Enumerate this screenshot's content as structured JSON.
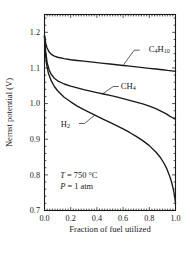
{
  "chart_data": {
    "type": "line",
    "title": "",
    "xlabel": "Fraction of fuel utilized",
    "ylabel": "Nernst potential (V)",
    "xlim": [
      0.0,
      1.0
    ],
    "ylim": [
      0.7,
      1.25
    ],
    "xticks": [
      0.0,
      0.2,
      0.4,
      0.6,
      0.8,
      1.0
    ],
    "xticklabels": [
      "0.0",
      "0.2",
      "0.4",
      "0.6",
      "0.8",
      "1.0"
    ],
    "yticks": [
      0.7,
      0.8,
      0.9,
      1.0,
      1.1,
      1.2
    ],
    "yticklabels": [
      "0.7",
      "0.8",
      "0.9",
      "1.0",
      "1.1",
      "1.2"
    ],
    "grid": false,
    "legend_position": "inline-labels",
    "minor_ticks": true,
    "tick_direction": "in",
    "frame": "box",
    "annotations": [
      {
        "name": "temperature",
        "text": "T = 750 °C",
        "x": 0.12,
        "y": 0.8
      },
      {
        "name": "pressure",
        "text": "P = 1 atm",
        "x": 0.12,
        "y": 0.768
      }
    ],
    "series": [
      {
        "name": "C4H10",
        "label": "C₄H₁₀",
        "label_x": 0.72,
        "label_y": 1.152,
        "color": "#1a1a1a",
        "points": [
          [
            0.0,
            1.19
          ],
          [
            0.01,
            1.168
          ],
          [
            0.02,
            1.156
          ],
          [
            0.035,
            1.145
          ],
          [
            0.05,
            1.139
          ],
          [
            0.075,
            1.133
          ],
          [
            0.1,
            1.13
          ],
          [
            0.15,
            1.126
          ],
          [
            0.2,
            1.123
          ],
          [
            0.25,
            1.121
          ],
          [
            0.3,
            1.119
          ],
          [
            0.35,
            1.117
          ],
          [
            0.4,
            1.115
          ],
          [
            0.45,
            1.113
          ],
          [
            0.5,
            1.111
          ],
          [
            0.55,
            1.109
          ],
          [
            0.6,
            1.107
          ],
          [
            0.65,
            1.105
          ],
          [
            0.7,
            1.103
          ],
          [
            0.75,
            1.101
          ],
          [
            0.8,
            1.099
          ],
          [
            0.85,
            1.097
          ],
          [
            0.9,
            1.095
          ],
          [
            0.94,
            1.093
          ],
          [
            0.97,
            1.092
          ],
          [
            0.99,
            1.091
          ],
          [
            1.0,
            1.09
          ]
        ]
      },
      {
        "name": "CH4",
        "label": "CH₄",
        "label_x": 0.56,
        "label_y": 1.048,
        "color": "#1a1a1a",
        "points": [
          [
            0.0,
            1.19
          ],
          [
            0.008,
            1.15
          ],
          [
            0.02,
            1.115
          ],
          [
            0.035,
            1.095
          ],
          [
            0.05,
            1.083
          ],
          [
            0.075,
            1.071
          ],
          [
            0.1,
            1.064
          ],
          [
            0.15,
            1.055
          ],
          [
            0.2,
            1.049
          ],
          [
            0.25,
            1.044
          ],
          [
            0.3,
            1.039
          ],
          [
            0.35,
            1.035
          ],
          [
            0.4,
            1.031
          ],
          [
            0.45,
            1.027
          ],
          [
            0.5,
            1.023
          ],
          [
            0.55,
            1.019
          ],
          [
            0.6,
            1.014
          ],
          [
            0.65,
            1.009
          ],
          [
            0.7,
            1.004
          ],
          [
            0.75,
            0.999
          ],
          [
            0.8,
            0.993
          ],
          [
            0.85,
            0.986
          ],
          [
            0.9,
            0.977
          ],
          [
            0.93,
            0.971
          ],
          [
            0.955,
            0.965
          ],
          [
            0.975,
            0.961
          ],
          [
            0.99,
            0.958
          ],
          [
            1.0,
            0.956
          ]
        ]
      },
      {
        "name": "H2",
        "label": "H₂",
        "label_x": 0.24,
        "label_y": 0.944,
        "color": "#1a1a1a",
        "points": [
          [
            0.0,
            1.19
          ],
          [
            0.006,
            1.145
          ],
          [
            0.015,
            1.112
          ],
          [
            0.03,
            1.085
          ],
          [
            0.05,
            1.065
          ],
          [
            0.075,
            1.048
          ],
          [
            0.1,
            1.036
          ],
          [
            0.15,
            1.018
          ],
          [
            0.2,
            1.005
          ],
          [
            0.25,
            0.993
          ],
          [
            0.3,
            0.983
          ],
          [
            0.35,
            0.974
          ],
          [
            0.4,
            0.965
          ],
          [
            0.45,
            0.956
          ],
          [
            0.5,
            0.947
          ],
          [
            0.55,
            0.938
          ],
          [
            0.6,
            0.929
          ],
          [
            0.65,
            0.919
          ],
          [
            0.7,
            0.908
          ],
          [
            0.75,
            0.896
          ],
          [
            0.8,
            0.882
          ],
          [
            0.85,
            0.864
          ],
          [
            0.88,
            0.851
          ],
          [
            0.91,
            0.834
          ],
          [
            0.935,
            0.816
          ],
          [
            0.955,
            0.797
          ],
          [
            0.97,
            0.78
          ],
          [
            0.98,
            0.765
          ],
          [
            0.988,
            0.751
          ],
          [
            0.994,
            0.738
          ],
          [
            0.998,
            0.727
          ],
          [
            1.0,
            0.72
          ]
        ]
      }
    ],
    "leaders": [
      {
        "name": "leader-c4h10",
        "from_x": 0.6,
        "from_y": 1.107,
        "to_x": 0.685,
        "to_y": 1.15
      },
      {
        "name": "leader-ch4",
        "from_x": 0.445,
        "from_y": 1.028,
        "to_x": 0.525,
        "to_y": 1.048
      },
      {
        "name": "leader-h2",
        "from_x": 0.385,
        "from_y": 0.968,
        "to_x": 0.305,
        "to_y": 0.944
      }
    ]
  }
}
